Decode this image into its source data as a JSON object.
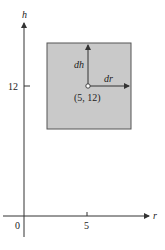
{
  "diagram": {
    "axes": {
      "vertical_label": "h",
      "horizontal_label": "r",
      "origin_label": "0",
      "x_tick_label": "5",
      "y_tick_label": "12"
    },
    "region": {
      "fill_color": "#c9c9c9",
      "border_color": "#555555"
    },
    "point": {
      "label": "(5, 12)"
    },
    "vectors": {
      "vertical_label": "dh",
      "horizontal_label": "dr"
    }
  }
}
